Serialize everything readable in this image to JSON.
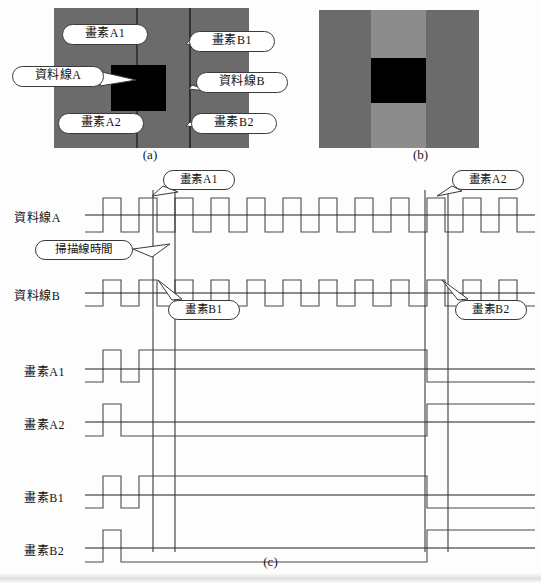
{
  "figure": {
    "panels": [
      {
        "id": "a",
        "caption": "(a)"
      },
      {
        "id": "b",
        "caption": "(b)"
      },
      {
        "id": "c",
        "caption": "(c)"
      }
    ]
  },
  "panel_a": {
    "caption": "(a)",
    "background_gray": "#6b6b6b",
    "stripe_gray": "#6b6b6b",
    "block_color": "#000000",
    "callouts": [
      {
        "key": "pixel_a1",
        "label": "畫素A1",
        "x": 62,
        "y": 24,
        "w": 86,
        "h": 24
      },
      {
        "key": "data_line_a",
        "label": "資料線A",
        "x": 12,
        "y": 66,
        "w": 92,
        "h": 25
      },
      {
        "key": "pixel_a2",
        "label": "畫素A2",
        "x": 58,
        "y": 113,
        "w": 86,
        "h": 24
      },
      {
        "key": "pixel_b1",
        "label": "畫素B1",
        "x": 189,
        "y": 31,
        "w": 86,
        "h": 25
      },
      {
        "key": "data_line_b",
        "label": "資料線B",
        "x": 196,
        "y": 72,
        "w": 92,
        "h": 25
      },
      {
        "key": "pixel_b2",
        "label": "畫素B2",
        "x": 191,
        "y": 113,
        "w": 86,
        "h": 24
      }
    ]
  },
  "panel_b": {
    "caption": "(b)",
    "background_gray": "#6b6b6b",
    "center_stripe_gray": "#8c8c8c",
    "block_color": "#000000"
  },
  "panel_c": {
    "caption": "(c)",
    "row_labels": [
      {
        "key": "data_line_a",
        "label": "資料線A"
      },
      {
        "key": "data_line_b",
        "label": "資料線B"
      },
      {
        "key": "pixel_a1",
        "label": "畫素A1"
      },
      {
        "key": "pixel_a2",
        "label": "畫素A2"
      },
      {
        "key": "pixel_b1",
        "label": "畫素B1"
      },
      {
        "key": "pixel_b2",
        "label": "畫素B2"
      }
    ],
    "callouts": [
      {
        "key": "pixel_a1",
        "label": "畫素A1",
        "x": 163,
        "y": 170,
        "w": 72,
        "h": 23
      },
      {
        "key": "scan_line_time",
        "label": "掃描線時間",
        "x": 35,
        "y": 240,
        "w": 98,
        "h": 25
      },
      {
        "key": "pixel_b1",
        "label": "畫素B1",
        "x": 168,
        "y": 300,
        "w": 72,
        "h": 23
      },
      {
        "key": "pixel_a2",
        "label": "畫素A2",
        "x": 452,
        "y": 170,
        "w": 72,
        "h": 23
      },
      {
        "key": "pixel_b2",
        "label": "畫素B2",
        "x": 455,
        "y": 300,
        "w": 72,
        "h": 23
      }
    ],
    "marker_lines_x": [
      153,
      175,
      425,
      448
    ],
    "stroke_color": "#4a4a4a",
    "baseline_color": "#222222"
  },
  "chart_data": {
    "type": "line",
    "title": "",
    "xlabel": "",
    "ylabel": "",
    "x_range": [
      85,
      535
    ],
    "signals": [
      {
        "name": "資料線A",
        "baseline_y": 215,
        "high_offset": -17,
        "low_offset": 17,
        "levels": [
          0,
          1,
          0,
          1,
          -1,
          1,
          -1,
          1,
          -1,
          1,
          -1,
          1,
          -1,
          1,
          -1,
          1,
          -1,
          1,
          0,
          1,
          0,
          1,
          0,
          1,
          0
        ]
      },
      {
        "name": "資料線B",
        "baseline_y": 293,
        "high_offset": -13,
        "low_offset": 13,
        "levels": [
          0,
          1,
          0,
          1,
          0,
          1,
          0,
          1,
          0,
          1,
          0,
          1,
          0,
          1,
          0,
          1,
          0,
          1,
          0,
          1,
          0,
          1,
          0,
          1,
          0
        ]
      },
      {
        "name": "畫素A1",
        "baseline_y": 369,
        "high_offset": -19,
        "low_offset": 13,
        "levels": [
          0,
          1,
          0,
          2,
          2,
          2,
          2,
          2,
          2,
          2,
          2,
          2,
          2,
          2,
          2,
          2,
          2,
          2,
          2,
          0,
          0,
          0,
          0,
          0,
          0
        ]
      },
      {
        "name": "畫素A2",
        "baseline_y": 422,
        "high_offset": -18,
        "low_offset": 14,
        "levels": [
          0,
          1,
          0,
          0,
          0,
          0,
          0,
          0,
          0,
          0,
          0,
          0,
          0,
          0,
          0,
          0,
          0,
          0,
          0,
          2,
          2,
          2,
          2,
          2,
          2
        ]
      },
      {
        "name": "畫素B1",
        "baseline_y": 495,
        "high_offset": -19,
        "low_offset": 13,
        "levels": [
          0,
          1,
          0,
          2,
          2,
          2,
          2,
          2,
          2,
          2,
          2,
          2,
          2,
          2,
          2,
          2,
          2,
          2,
          2,
          0,
          0,
          0,
          0,
          0,
          0
        ]
      },
      {
        "name": "畫素B2",
        "baseline_y": 548,
        "high_offset": -18,
        "low_offset": 14,
        "levels": [
          0,
          1,
          0,
          0,
          0,
          0,
          0,
          0,
          0,
          0,
          0,
          0,
          0,
          0,
          0,
          0,
          0,
          0,
          0,
          2,
          2,
          2,
          2,
          2,
          2
        ]
      }
    ]
  }
}
